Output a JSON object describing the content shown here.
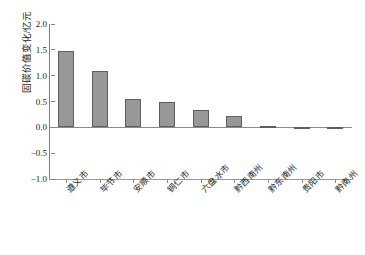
{
  "chart_data": {
    "type": "bar",
    "title": "",
    "xlabel": "",
    "ylabel": "固碳价值变化/亿元",
    "ylim": [
      -1.0,
      2.0
    ],
    "yticks": [
      "2.0",
      "1.5",
      "1.0",
      "0.5",
      "0.0",
      "-0.5",
      "-1.0"
    ],
    "ytick_values": [
      2.0,
      1.5,
      1.0,
      0.5,
      0.0,
      -0.5,
      -1.0
    ],
    "grid": false,
    "legend": "none",
    "bar_color": "#989898",
    "bar_edge_color": "#5e5e5e",
    "axis_color": "#8c8c8c",
    "categories": [
      "遵义市",
      "毕节市",
      "安顺市",
      "铜仁市",
      "六盘水市",
      "黔西南州",
      "黔东南州",
      "贵阳市",
      "黔南州"
    ],
    "values": [
      1.48,
      1.1,
      0.55,
      0.5,
      0.34,
      0.21,
      0.03,
      0.0,
      -0.02
    ]
  }
}
